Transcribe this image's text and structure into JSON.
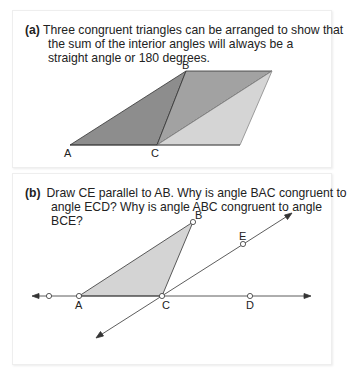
{
  "panel_a": {
    "tag": "(a)",
    "text_line1": "Three congruent triangles can be arranged to show that",
    "text_rest": "the sum of the interior angles will always be a straight angle or 180 degrees.",
    "labels": {
      "A": "A",
      "B": "B",
      "C": "C"
    },
    "colors": {
      "dark": "#8c8c8c",
      "mid": "#a3a3a3",
      "light": "#d6d6d6"
    }
  },
  "panel_b": {
    "tag": "(b)",
    "text_line1": "Draw CE parallel to AB. Why is angle BAC congruent to",
    "text_rest": "angle ECD? Why is angle ABC congruent to angle BCE?",
    "labels": {
      "A": "A",
      "B": "B",
      "C": "C",
      "D": "D",
      "E": "E"
    },
    "colors": {
      "triangle": "#d4d4d4"
    }
  }
}
